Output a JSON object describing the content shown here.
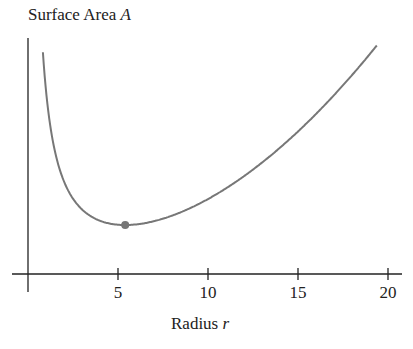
{
  "chart_data": {
    "type": "line",
    "title": "",
    "ylabel": "Surface Area",
    "ylabel_var": "A",
    "xlabel": "Radius",
    "xlabel_var": "r",
    "xticks": [
      5,
      10,
      15,
      20
    ],
    "xlim": [
      0,
      21
    ],
    "yticks": [],
    "grid": false,
    "legend": null,
    "curve": {
      "formula": "A = r^2 + 315/r (unitless, schematic)",
      "r_start": 0.83,
      "r_end": 19.4,
      "color": "#777777"
    },
    "highlight_point": {
      "r": 5.4,
      "label": "minimum",
      "color": "#777777"
    },
    "x": [
      0.83,
      1,
      2,
      3,
      4,
      5,
      5.4,
      6,
      8,
      10,
      12,
      14,
      16,
      18,
      19.4
    ],
    "values": [
      380.2,
      316,
      161.5,
      114,
      95,
      88,
      87.5,
      88.5,
      103.4,
      131.5,
      170.3,
      218.5,
      275.7,
      341.5,
      392.6
    ]
  }
}
